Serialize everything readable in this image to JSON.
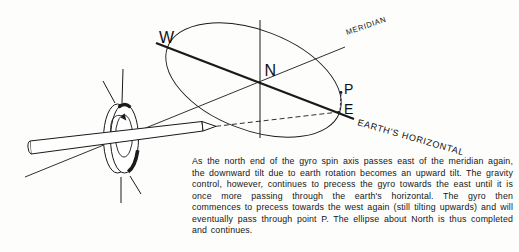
{
  "figure": {
    "labels": {
      "west": "W",
      "north": "N",
      "point_p": "P",
      "east": "E",
      "meridian": "MERIDIAN",
      "earths_horizontal": "EARTH'S HORIZONTAL"
    },
    "caption": "As the north end of the gyro spin axis passes east of the meridian again, the downward tilt due to earth rotation becomes an upward tilt. The gravity control, however, continues to precess the gyro towards the east until it is once more passing through the earth's horizontal. The gyro then commences to precess towards the west again (still tilting upwards) and will eventually pass through point P. The ellipse about North is thus completed and continues.",
    "colors": {
      "ink": "#1a1a1a",
      "paper": "#fdfdfb"
    }
  }
}
